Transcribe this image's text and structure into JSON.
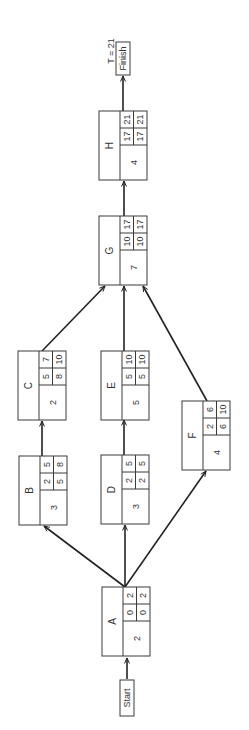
{
  "diagram": {
    "type": "activity-on-node network (CPM)",
    "orientation": "rotated 90deg counter-clockwise",
    "total_time_label": "T = 21",
    "start_label": "Start",
    "finish_label": "Finish",
    "nodes": [
      {
        "id": "A",
        "duration": "2",
        "es": "0",
        "ef": "2",
        "ls": "0",
        "lf": "2",
        "x": 102,
        "y": 587
      },
      {
        "id": "B",
        "duration": "3",
        "es": "2",
        "ef": "5",
        "ls": "5",
        "lf": "8",
        "x": 19,
        "y": 456
      },
      {
        "id": "C",
        "duration": "2",
        "es": "5",
        "ef": "7",
        "ls": "8",
        "lf": "10",
        "x": 18,
        "y": 351
      },
      {
        "id": "D",
        "duration": "3",
        "es": "2",
        "ef": "5",
        "ls": "2",
        "lf": "5",
        "x": 101,
        "y": 455
      },
      {
        "id": "E",
        "duration": "5",
        "es": "5",
        "ef": "10",
        "ls": "5",
        "lf": "10",
        "x": 101,
        "y": 351
      },
      {
        "id": "F",
        "duration": "4",
        "es": "2",
        "ef": "6",
        "ls": "6",
        "lf": "10",
        "x": 182,
        "y": 401
      },
      {
        "id": "G",
        "duration": "7",
        "es": "10",
        "ef": "17",
        "ls": "10",
        "lf": "17",
        "x": 99,
        "y": 216
      },
      {
        "id": "H",
        "duration": "4",
        "es": "17",
        "ef": "21",
        "ls": "17",
        "lf": "21",
        "x": 99,
        "y": 111
      }
    ],
    "edges": [
      {
        "from": "Start",
        "to": "A",
        "x1": 127,
        "y1": 679,
        "x2": 127,
        "y2": 658
      },
      {
        "from": "A",
        "to": "B",
        "x1": 125,
        "y1": 587,
        "x2": 44,
        "y2": 526
      },
      {
        "from": "A",
        "to": "D",
        "x1": 125,
        "y1": 587,
        "x2": 125,
        "y2": 525
      },
      {
        "from": "A",
        "to": "F",
        "x1": 125,
        "y1": 587,
        "x2": 206,
        "y2": 471
      },
      {
        "from": "B",
        "to": "C",
        "x1": 42,
        "y1": 456,
        "x2": 42,
        "y2": 421
      },
      {
        "from": "D",
        "to": "E",
        "x1": 124,
        "y1": 455,
        "x2": 124,
        "y2": 420
      },
      {
        "from": "C",
        "to": "G",
        "x1": 42,
        "y1": 351,
        "x2": 105,
        "y2": 286
      },
      {
        "from": "E",
        "to": "G",
        "x1": 124,
        "y1": 351,
        "x2": 124,
        "y2": 286
      },
      {
        "from": "F",
        "to": "G",
        "x1": 207,
        "y1": 401,
        "x2": 143,
        "y2": 286
      },
      {
        "from": "G",
        "to": "H",
        "x1": 124,
        "y1": 216,
        "x2": 124,
        "y2": 181
      },
      {
        "from": "H",
        "to": "Finish",
        "x1": 123,
        "y1": 111,
        "x2": 123,
        "y2": 76
      }
    ],
    "start_box": {
      "x": 120,
      "y": 680,
      "w": 14,
      "h": 36
    },
    "finish_box": {
      "x": 116,
      "y": 42,
      "w": 14,
      "h": 33
    },
    "total_time_pos": {
      "x": 111,
      "y": 51
    }
  }
}
